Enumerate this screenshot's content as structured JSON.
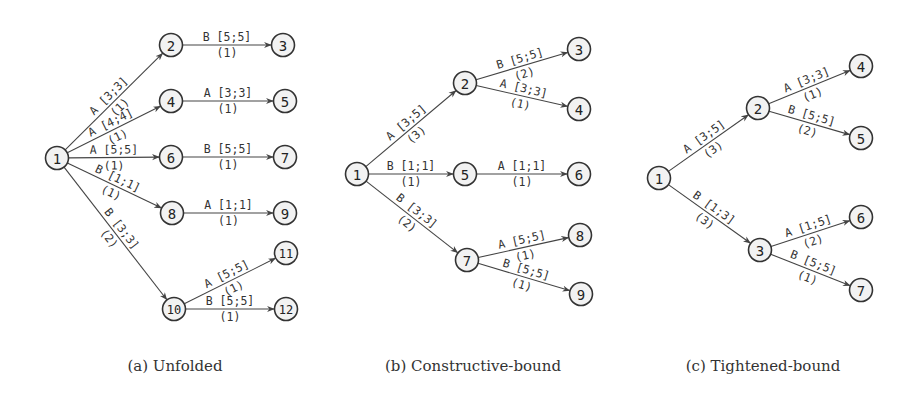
{
  "captions": [
    {
      "text": "(a) Unfolded",
      "x": 175
    },
    {
      "text": "(b) Constructive-bound",
      "x": 473
    },
    {
      "text": "(c) Tightened-bound",
      "x": 763
    }
  ],
  "diagrams": [
    {
      "id": "unfolded",
      "nodes": [
        {
          "id": "1",
          "x": 57,
          "y": 158
        },
        {
          "id": "2",
          "x": 171,
          "y": 45
        },
        {
          "id": "3",
          "x": 283,
          "y": 45
        },
        {
          "id": "4",
          "x": 171,
          "y": 101
        },
        {
          "id": "5",
          "x": 285,
          "y": 101
        },
        {
          "id": "6",
          "x": 171,
          "y": 157
        },
        {
          "id": "7",
          "x": 285,
          "y": 157
        },
        {
          "id": "8",
          "x": 172,
          "y": 213
        },
        {
          "id": "9",
          "x": 285,
          "y": 213
        },
        {
          "id": "10",
          "x": 174,
          "y": 309
        },
        {
          "id": "11",
          "x": 286,
          "y": 253
        },
        {
          "id": "12",
          "x": 286,
          "y": 309
        }
      ],
      "edges": [
        {
          "from": "1",
          "to": "2",
          "label": "A [3;3]",
          "count": "(1)"
        },
        {
          "from": "2",
          "to": "3",
          "label": "B [5;5]",
          "count": "(1)"
        },
        {
          "from": "1",
          "to": "4",
          "label": "A [4;4]",
          "count": "(1)"
        },
        {
          "from": "4",
          "to": "5",
          "label": "A [3;3]",
          "count": "(1)"
        },
        {
          "from": "1",
          "to": "6",
          "label": "A [5;5]",
          "count": "(1)"
        },
        {
          "from": "6",
          "to": "7",
          "label": "B [5;5]",
          "count": "(1)"
        },
        {
          "from": "1",
          "to": "8",
          "label": "B [1;1]",
          "count": "(1)"
        },
        {
          "from": "8",
          "to": "9",
          "label": "A [1;1]",
          "count": "(1)"
        },
        {
          "from": "1",
          "to": "10",
          "label": "B [3;3]",
          "count": "(2)"
        },
        {
          "from": "10",
          "to": "11",
          "label": "A [5;5]",
          "count": "(1)"
        },
        {
          "from": "10",
          "to": "12",
          "label": "B [5;5]",
          "count": "(1)"
        }
      ]
    },
    {
      "id": "constructive-bound",
      "nodes": [
        {
          "id": "1",
          "x": 357,
          "y": 174
        },
        {
          "id": "2",
          "x": 465,
          "y": 83
        },
        {
          "id": "3",
          "x": 579,
          "y": 49
        },
        {
          "id": "4",
          "x": 579,
          "y": 109
        },
        {
          "id": "5",
          "x": 465,
          "y": 174
        },
        {
          "id": "6",
          "x": 579,
          "y": 174
        },
        {
          "id": "7",
          "x": 467,
          "y": 260
        },
        {
          "id": "8",
          "x": 580,
          "y": 235
        },
        {
          "id": "9",
          "x": 581,
          "y": 294
        }
      ],
      "edges": [
        {
          "from": "1",
          "to": "2",
          "label": "A [3;5]",
          "count": "(3)"
        },
        {
          "from": "2",
          "to": "3",
          "label": "B [5;5]",
          "count": "(2)"
        },
        {
          "from": "2",
          "to": "4",
          "label": "A [3;3]",
          "count": "(1)"
        },
        {
          "from": "1",
          "to": "5",
          "label": "B [1;1]",
          "count": "(1)"
        },
        {
          "from": "5",
          "to": "6",
          "label": "A [1;1]",
          "count": "(1)"
        },
        {
          "from": "1",
          "to": "7",
          "label": "B [3;3]",
          "count": "(2)"
        },
        {
          "from": "7",
          "to": "8",
          "label": "A [5;5]",
          "count": "(1)"
        },
        {
          "from": "7",
          "to": "9",
          "label": "B [5;5]",
          "count": "(1)"
        }
      ]
    },
    {
      "id": "tightened-bound",
      "nodes": [
        {
          "id": "1",
          "x": 659,
          "y": 178
        },
        {
          "id": "2",
          "x": 758,
          "y": 108
        },
        {
          "id": "3",
          "x": 760,
          "y": 250
        },
        {
          "id": "4",
          "x": 861,
          "y": 66
        },
        {
          "id": "5",
          "x": 861,
          "y": 138
        },
        {
          "id": "6",
          "x": 861,
          "y": 217
        },
        {
          "id": "7",
          "x": 861,
          "y": 290
        }
      ],
      "edges": [
        {
          "from": "1",
          "to": "2",
          "label": "A [3;5]",
          "count": "(3)"
        },
        {
          "from": "2",
          "to": "4",
          "label": "A [3;3]",
          "count": "(1)"
        },
        {
          "from": "2",
          "to": "5",
          "label": "B [5;5]",
          "count": "(2)"
        },
        {
          "from": "1",
          "to": "3",
          "label": "B [1;3]",
          "count": "(3)"
        },
        {
          "from": "3",
          "to": "6",
          "label": "A [1;5]",
          "count": "(2)"
        },
        {
          "from": "3",
          "to": "7",
          "label": "B [5;5]",
          "count": "(1)"
        }
      ]
    }
  ],
  "style": {
    "node_radius": 11.5,
    "stroke_color": "#333333",
    "node_fill": "#f2f2f2",
    "edge_color": "#444444"
  }
}
